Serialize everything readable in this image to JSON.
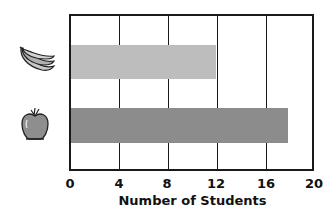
{
  "chart_data": {
    "type": "bar",
    "orientation": "horizontal",
    "title": "",
    "xlabel": "Number of Students",
    "ylabel": "",
    "categories": [
      "Bananas",
      "Apples"
    ],
    "category_icons": [
      "banana-icon",
      "apple-icon"
    ],
    "values": [
      12,
      18
    ],
    "bar_colors": [
      "#bdbdbd",
      "#8c8c8c"
    ],
    "xlim": [
      0,
      20
    ],
    "xticks": [
      0,
      4,
      8,
      12,
      16,
      20
    ],
    "grid": true,
    "legend": null
  },
  "axis": {
    "xlabel": "Number of Students",
    "ticks": [
      "0",
      "4",
      "8",
      "12",
      "16",
      "20"
    ]
  }
}
